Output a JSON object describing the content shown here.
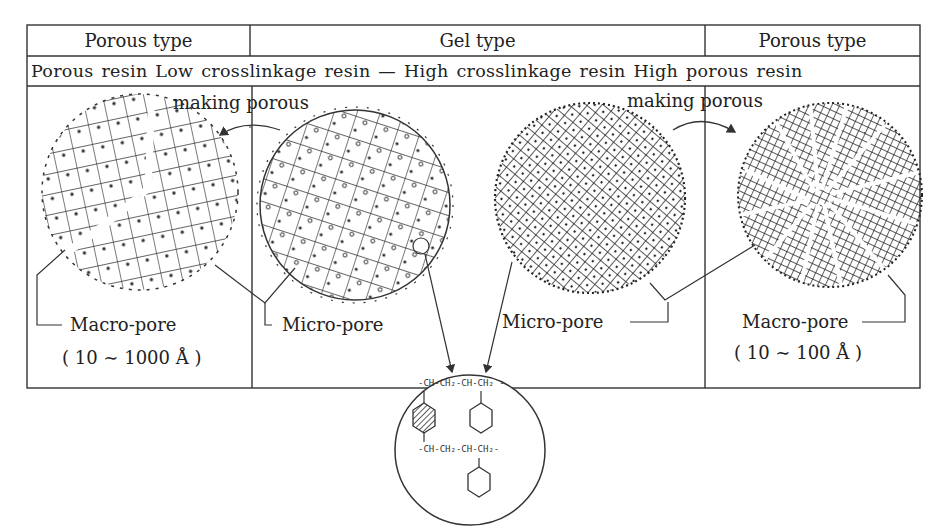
{
  "table": {
    "header": {
      "col1": "Porous type",
      "col2": "Gel type",
      "col3": "Porous type"
    },
    "subheader": "Porous resin Low crosslinkage resin — High crosslinkage resin High porous resin"
  },
  "arrows": {
    "left": "making porous",
    "right": "making porous"
  },
  "labels": {
    "macro_left": "Macro-pore",
    "macro_left_range": "( 10 ∼ 1000 Å )",
    "micro_left": "Micro-pore",
    "micro_right": "Micro-pore",
    "macro_right": "Macro-pore",
    "macro_right_range": "( 10 ∼ 100 Å )"
  },
  "structure": {
    "top_chain": "-CH-CH₂-CH-CH₂ -",
    "bottom_chain": "-CH-CH₂-CH-CH₂-",
    "crosslink_ring": "hatched-benzene-ring",
    "pendant_ring": "benzene-ring"
  },
  "spheres": [
    {
      "name": "porous-resin",
      "type": "macro-porous, segmented"
    },
    {
      "name": "low-crosslinkage-resin",
      "type": "open gel network"
    },
    {
      "name": "high-crosslinkage-resin",
      "type": "dense gel network"
    },
    {
      "name": "high-porous-resin",
      "type": "radial macro-porous"
    }
  ]
}
